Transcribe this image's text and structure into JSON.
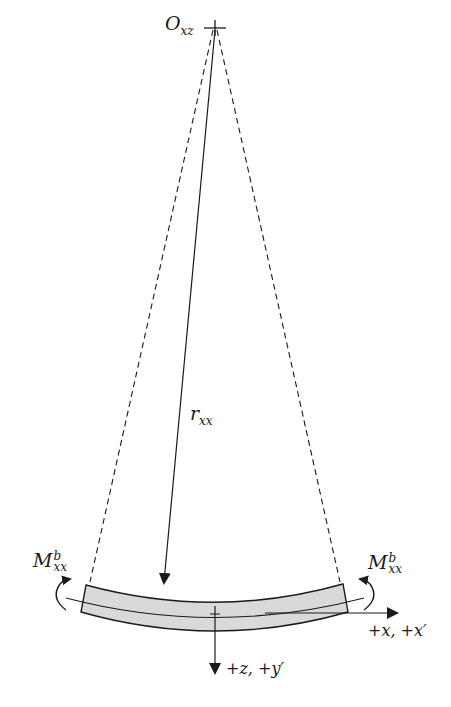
{
  "diagram": {
    "type": "beam-bending",
    "colors": {
      "ink": "#1a1a1a",
      "beam_fill": "#d9d9d9",
      "background": "#ffffff"
    },
    "labels": {
      "origin": {
        "base": "O",
        "sub": "xz"
      },
      "radius": {
        "base": "r",
        "sub": "xx"
      },
      "moment_left": {
        "base": "M",
        "sub": "xx",
        "sup": "b"
      },
      "moment_right": {
        "base": "M",
        "sub": "xx",
        "sup": "b"
      },
      "x_axis": "+x, +x′",
      "z_axis": "+z, +y′"
    }
  }
}
